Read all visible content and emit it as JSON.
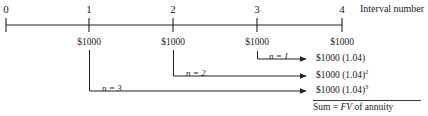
{
  "figure": {
    "title_label": "Interval number",
    "axis": {
      "ticks": [
        {
          "label": "0",
          "x": 6
        },
        {
          "label": "1",
          "x": 89
        },
        {
          "label": "2",
          "x": 173
        },
        {
          "label": "3",
          "x": 257
        },
        {
          "label": "4",
          "x": 342
        }
      ],
      "line_y": 25
    },
    "cash_flows": [
      {
        "label": "$1000",
        "x": 89
      },
      {
        "label": "$1000",
        "x": 173
      },
      {
        "label": "$1000",
        "x": 257
      },
      {
        "label": "$1000",
        "x": 342
      }
    ],
    "periods": [
      {
        "n_label": "n = 1",
        "n_value": "1",
        "start_x": 257,
        "arrow_y": 59,
        "result": "$1000 (1.04)",
        "result_base": "$1000 (1.04)",
        "result_exp": ""
      },
      {
        "n_label": "n = 2",
        "n_value": "2",
        "start_x": 173,
        "arrow_y": 76,
        "result": "$1000 (1.04)2",
        "result_base": "$1000 (1.04)",
        "result_exp": "2"
      },
      {
        "n_label": "n = 3",
        "n_value": "3",
        "start_x": 89,
        "arrow_y": 91,
        "result": "$1000 (1.04)3",
        "result_base": "$1000 (1.04)",
        "result_exp": "3"
      }
    ],
    "sum": {
      "prefix": "Sum = ",
      "fv": "FV",
      "suffix": " of annuity",
      "full": "Sum = FV of annuity"
    },
    "colors": {
      "ink": "#1a1a1a",
      "line": "#222222",
      "background": "#ffffff"
    }
  }
}
